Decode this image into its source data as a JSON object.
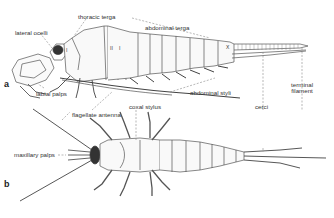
{
  "figure": {
    "panels": [
      {
        "id": "a",
        "label": "a",
        "view": "lateral"
      },
      {
        "id": "b",
        "label": "b",
        "view": "dorsal"
      }
    ],
    "labels": {
      "lateral_ocelli": "lateral ocelli",
      "thoracic_terga": "thoracic terga",
      "abdominal_terga": "abdominal terga",
      "labial_palps": "labial palps",
      "abdominal_styli": "abdominal styli",
      "cerci": "cerci",
      "terminal_filament": "terminal filament",
      "terminal_filament_line1": "terminal",
      "terminal_filament_line2": "filament",
      "flagellate_antenna": "flagellate antenna",
      "coxal_stylus": "coxal stylus",
      "maxillary_palps": "maxillary palps"
    },
    "segment_marks": {
      "thorax_1": "I",
      "thorax_2": "II",
      "thorax_3": "I",
      "abdomen_end": "X"
    },
    "colors": {
      "line": "#555555",
      "dark": "#333333",
      "leader": "#888888",
      "fill": "#f6f6f6"
    }
  }
}
